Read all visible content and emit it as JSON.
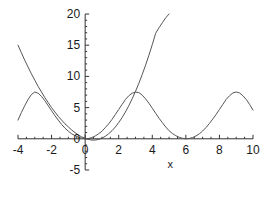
{
  "chart_data": {
    "type": "line",
    "title": "",
    "xlabel": "x",
    "ylabel": "",
    "xlim": [
      -4,
      10
    ],
    "ylim": [
      -5,
      20
    ],
    "grid": false,
    "legend": "none",
    "line_color": "#555555",
    "axis_color": "#333333",
    "background": "#ffffff",
    "xticks": [
      -4,
      -2,
      0,
      2,
      4,
      6,
      8,
      10
    ],
    "xtick_labels": [
      "-4",
      "-2",
      "0",
      "2",
      "4",
      "6",
      "8",
      "10"
    ],
    "yticks": [
      -5,
      0,
      5,
      10,
      15,
      20
    ],
    "ytick_labels": [
      "-5",
      "0",
      "5",
      "10",
      "15",
      "20"
    ],
    "x_minor_tick_step": 0.5,
    "y_minor_tick_step": 1,
    "series": [
      {
        "name": "steep-curve",
        "description": "steeply rising curve passing through origin region, dips slightly below zero near x=0.5, exits top of plot near x=5",
        "x": [
          -4.0,
          -3.8,
          -3.6,
          -3.4,
          -3.2,
          -3.0,
          -2.8,
          -2.6,
          -2.4,
          -2.2,
          -2.0,
          -1.8,
          -1.6,
          -1.4,
          -1.2,
          -1.0,
          -0.8,
          -0.6,
          -0.4,
          -0.2,
          0.0,
          0.2,
          0.4,
          0.6,
          0.8,
          1.0,
          1.2,
          1.4,
          1.6,
          1.8,
          2.0,
          2.2,
          2.4,
          2.6,
          2.8,
          3.0,
          3.2,
          3.4,
          3.6,
          3.8,
          4.0,
          4.2,
          4.4,
          4.6,
          4.8,
          5.0
        ],
        "y": [
          15.0,
          13.8,
          12.6,
          11.5,
          10.4,
          9.4,
          8.4,
          7.5,
          6.6,
          5.8,
          5.0,
          4.3,
          3.6,
          3.0,
          2.4,
          1.9,
          1.4,
          1.0,
          0.6,
          0.3,
          0.1,
          -0.1,
          -0.2,
          -0.2,
          -0.1,
          0.1,
          0.4,
          0.8,
          1.3,
          1.9,
          2.6,
          3.4,
          4.3,
          5.3,
          6.4,
          7.6,
          8.9,
          10.3,
          11.8,
          13.4,
          15.1,
          16.9,
          17.8,
          18.6,
          19.4,
          20.0
        ]
      },
      {
        "name": "oscillating-bump-curve",
        "description": "periodic bump curve, period 6, peaks of height about 7.5 at x = -3, 3 and 9, troughs near zero at x = 0, 6",
        "x": [
          -4.0,
          -3.8,
          -3.6,
          -3.4,
          -3.2,
          -3.0,
          -2.8,
          -2.6,
          -2.4,
          -2.2,
          -2.0,
          -1.8,
          -1.6,
          -1.4,
          -1.2,
          -1.0,
          -0.8,
          -0.6,
          -0.4,
          -0.2,
          0.0,
          0.2,
          0.4,
          0.6,
          0.8,
          1.0,
          1.2,
          1.4,
          1.6,
          1.8,
          2.0,
          2.2,
          2.4,
          2.6,
          2.8,
          3.0,
          3.2,
          3.4,
          3.6,
          3.8,
          4.0,
          4.2,
          4.4,
          4.6,
          4.8,
          5.0,
          5.2,
          5.4,
          5.6,
          5.8,
          6.0,
          6.2,
          6.4,
          6.6,
          6.8,
          7.0,
          7.2,
          7.4,
          7.6,
          7.8,
          8.0,
          8.2,
          8.4,
          8.6,
          8.8,
          9.0,
          9.2,
          9.4,
          9.6,
          9.8,
          10.0
        ],
        "y": [
          3.0,
          4.2,
          5.3,
          6.3,
          7.1,
          7.5,
          7.3,
          6.8,
          6.1,
          5.3,
          4.5,
          3.7,
          3.0,
          2.3,
          1.7,
          1.2,
          0.8,
          0.5,
          0.25,
          0.1,
          0.0,
          0.05,
          0.2,
          0.45,
          0.8,
          1.2,
          1.8,
          2.4,
          3.1,
          3.9,
          4.7,
          5.5,
          6.3,
          6.9,
          7.3,
          7.5,
          7.4,
          7.0,
          6.4,
          5.7,
          4.9,
          4.1,
          3.3,
          2.6,
          1.9,
          1.3,
          0.85,
          0.5,
          0.25,
          0.08,
          0.0,
          0.05,
          0.2,
          0.45,
          0.8,
          1.25,
          1.8,
          2.45,
          3.15,
          3.9,
          4.7,
          5.5,
          6.3,
          6.9,
          7.35,
          7.5,
          7.35,
          6.9,
          6.3,
          5.5,
          4.6
        ]
      }
    ]
  },
  "axis_label_x": "x"
}
